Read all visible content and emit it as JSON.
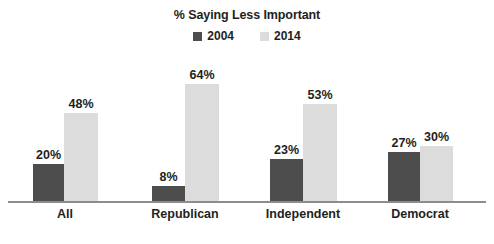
{
  "chart_data": {
    "type": "bar",
    "title": "% Saying Less Important",
    "xlabel": "",
    "ylabel": "",
    "ylim": [
      0,
      70
    ],
    "grid": false,
    "legend_position": "top-center",
    "categories": [
      "All",
      "Republican",
      "Independent",
      "Democrat"
    ],
    "series": [
      {
        "name": "2004",
        "color": "#4d4d4d",
        "values": [
          20,
          8,
          23,
          27
        ],
        "value_labels": [
          "20%",
          "8%",
          "23%",
          "27%"
        ]
      },
      {
        "name": "2014",
        "color": "#dcdcdc",
        "values": [
          48,
          64,
          53,
          30
        ],
        "value_labels": [
          "48%",
          "64%",
          "53%",
          "30%"
        ]
      }
    ]
  },
  "legend": {
    "items": [
      {
        "label": "2004",
        "color": "#4d4d4d"
      },
      {
        "label": "2014",
        "color": "#dcdcdc"
      }
    ]
  },
  "axis": {
    "baseline_color": "#8d8d8d"
  },
  "groups": [
    {
      "name": "All",
      "x_center": 65,
      "bars": [
        {
          "series": "2004",
          "value": 20,
          "label": "20%",
          "x": 33,
          "width": 31
        },
        {
          "series": "2014",
          "value": 48,
          "label": "48%",
          "x": 64,
          "width": 34
        }
      ]
    },
    {
      "name": "Republican",
      "x_center": 185,
      "bars": [
        {
          "series": "2004",
          "value": 8,
          "label": "8%",
          "x": 152,
          "width": 33
        },
        {
          "series": "2014",
          "value": 64,
          "label": "64%",
          "x": 185,
          "width": 34
        }
      ]
    },
    {
      "name": "Independent",
      "x_center": 303,
      "bars": [
        {
          "series": "2004",
          "value": 23,
          "label": "23%",
          "x": 270,
          "width": 33
        },
        {
          "series": "2014",
          "value": 53,
          "label": "53%",
          "x": 303,
          "width": 34
        }
      ]
    },
    {
      "name": "Democrat",
      "x_center": 420,
      "bars": [
        {
          "series": "2004",
          "value": 27,
          "label": "27%",
          "x": 388,
          "width": 32
        },
        {
          "series": "2014",
          "value": 30,
          "label": "30%",
          "x": 420,
          "width": 33
        }
      ]
    }
  ]
}
